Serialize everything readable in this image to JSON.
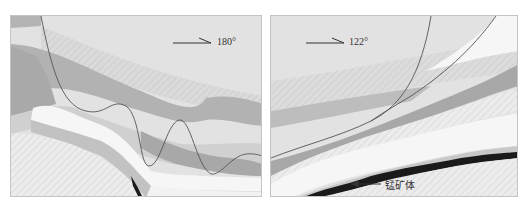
{
  "figure": {
    "type": "geological-cross-section",
    "panels": [
      {
        "id": "left",
        "direction_label": "180°",
        "arrow": "right-arrow"
      },
      {
        "id": "right",
        "direction_label": "122°",
        "arrow": "right-arrow",
        "annotation": "锰矿体"
      }
    ],
    "colors": {
      "background": "#e2e2e2",
      "band_dark": "#a8a8a8",
      "band_mid": "#bdbdbd",
      "band_light": "#d0d0d0",
      "white_layer": "#f6f6f6",
      "hatch_layer": "#ececec",
      "ore_body": "#1a1a1a",
      "contour_line": "#555555"
    }
  }
}
